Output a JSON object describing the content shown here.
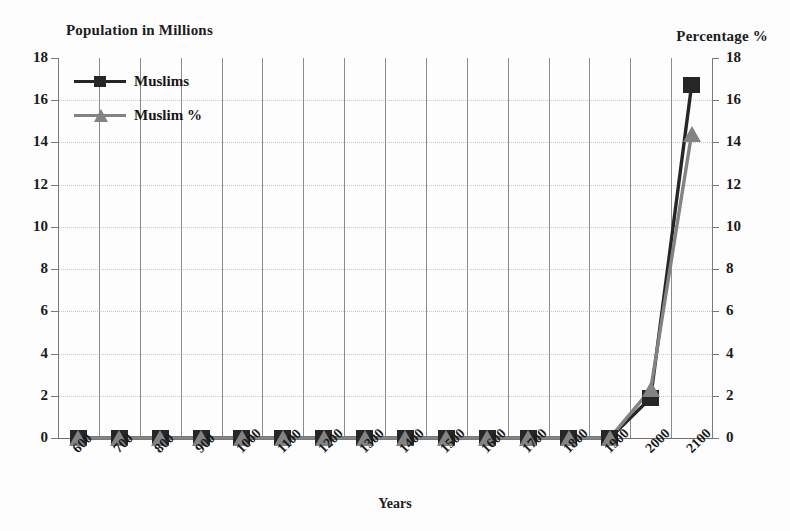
{
  "chart_data": {
    "type": "line",
    "title": "",
    "xlabel": "Years",
    "left_axis_title": "Population in Millions",
    "right_axis_title": "Percentage %",
    "categories": [
      "600",
      "700",
      "800",
      "900",
      "1000",
      "1100",
      "1200",
      "1300",
      "1400",
      "1500",
      "1600",
      "1700",
      "1800",
      "1900",
      "2000",
      "2100"
    ],
    "left_ticks": [
      "18",
      "16",
      "14",
      "12",
      "10",
      "8",
      "6",
      "4",
      "2",
      "0"
    ],
    "right_ticks": [
      "18",
      "16",
      "14",
      "12",
      "10",
      "8",
      "6",
      "4",
      "2",
      "0"
    ],
    "ylim": [
      0,
      18
    ],
    "y2lim": [
      0,
      18
    ],
    "grid": true,
    "legend_position": "top-left",
    "series": [
      {
        "name": "Muslims",
        "axis": "left",
        "color": "#262626",
        "marker": "square",
        "values": [
          0,
          0,
          0,
          0,
          0,
          0,
          0,
          0,
          0,
          0,
          0,
          0,
          0,
          0,
          1.9,
          16.7
        ]
      },
      {
        "name": "Muslim %",
        "axis": "right",
        "color": "#838383",
        "marker": "triangle",
        "values": [
          0,
          0,
          0,
          0,
          0,
          0,
          0,
          0,
          0,
          0,
          0,
          0,
          0,
          0,
          2.3,
          14.4
        ]
      }
    ]
  },
  "legend": {
    "items": [
      {
        "label": "Muslims"
      },
      {
        "label": "Muslim %"
      }
    ]
  },
  "colors": {
    "muslims": "#262626",
    "muslim_percent": "#838383",
    "grid": "#8c8c8c",
    "axis": "#7a7a7a",
    "text": "#1a1a1a"
  }
}
